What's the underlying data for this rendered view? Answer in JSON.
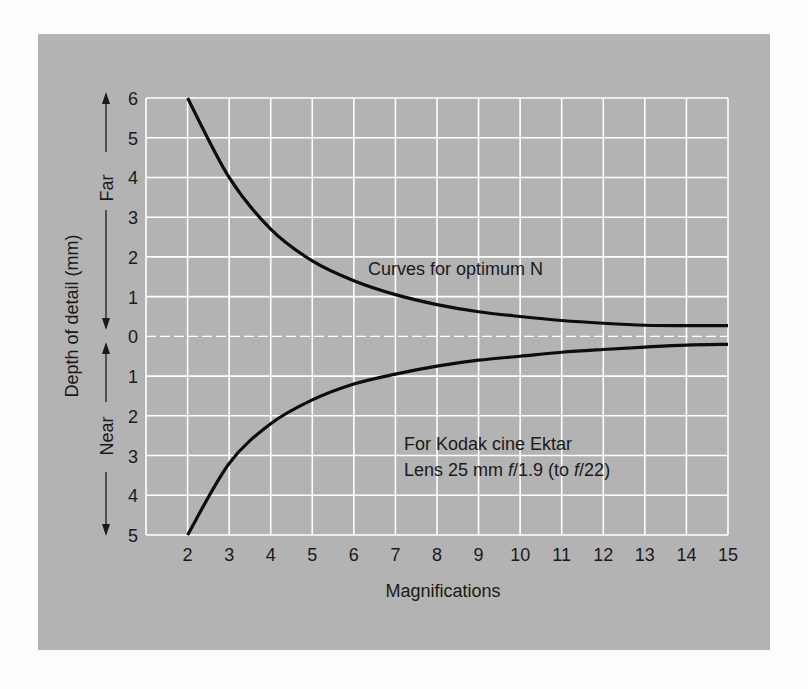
{
  "chart_data": {
    "type": "line",
    "title": "",
    "xlabel": "Magnifications",
    "ylabel": "Depth of detail (mm)",
    "y_direction_labels": {
      "far": "Far",
      "near": "Near"
    },
    "x_ticks": [
      2,
      3,
      4,
      5,
      6,
      7,
      8,
      9,
      10,
      11,
      12,
      13,
      14,
      15
    ],
    "y_ticks_far": [
      6,
      5,
      4,
      3,
      2,
      1,
      0
    ],
    "y_ticks_near": [
      1,
      2,
      3,
      4,
      5
    ],
    "xlim": [
      1,
      15
    ],
    "ylim": [
      -5,
      6
    ],
    "grid": true,
    "x": [
      2,
      3,
      4,
      5,
      6,
      7,
      8,
      9,
      10,
      11,
      12,
      13,
      14,
      15
    ],
    "series": [
      {
        "name": "Far",
        "values": [
          6.0,
          4.0,
          2.7,
          1.9,
          1.4,
          1.05,
          0.8,
          0.62,
          0.5,
          0.4,
          0.33,
          0.28,
          0.27,
          0.27
        ]
      },
      {
        "name": "Near",
        "values": [
          5.0,
          3.2,
          2.2,
          1.6,
          1.2,
          0.95,
          0.75,
          0.6,
          0.5,
          0.4,
          0.33,
          0.27,
          0.22,
          0.2
        ]
      }
    ],
    "annotations": [
      "Curves for optimum N",
      "For Kodak cine Ektar",
      "Lens 25 mm f/1.9 (to f/22)"
    ]
  },
  "labels": {
    "xlabel": "Magnifications",
    "ylabel": "Depth of detail (mm)",
    "far": "Far",
    "near": "Near",
    "annotation_curves": "Curves for optimum N",
    "annotation_lens_line1": "For Kodak cine Ektar",
    "annotation_lens_line2_a": "Lens 25 mm ",
    "annotation_lens_f1": "f",
    "annotation_lens_line2_b": "/1.9 (to ",
    "annotation_lens_f2": "f",
    "annotation_lens_line2_c": "/22)"
  },
  "colors": {
    "panel": "#b3b3b3",
    "grid": "#ffffff",
    "curve": "#0d0d0d",
    "text": "#1a1a1a"
  }
}
